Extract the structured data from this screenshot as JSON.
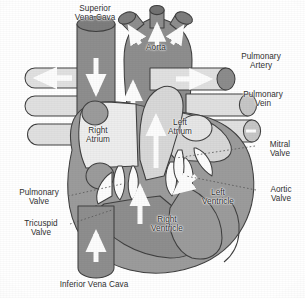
{
  "figure": {
    "type": "anatomical-diagram",
    "background_color": "#ffffff",
    "text_color": "#2e2e2e",
    "style": "grayscale scanned medical illustration"
  },
  "palette": {
    "deoxygenated_chamber": "#8c8c8c",
    "myocardium_wall": "#9a9a9a",
    "oxygenated_channel": "#d9d9d9",
    "vessel_light": "#e2e2e2",
    "vessel_cap_dark": "#7a7a7a",
    "valve_leaflet": "#ffffff",
    "outline": "#3a3a3a",
    "arrow": "#ffffff",
    "leader_line": "#555555"
  },
  "labels": [
    {
      "id": "superior-vena-cava",
      "text": "Superior\nVena Cava",
      "x": 58,
      "y": 4,
      "w": 74,
      "leader": false
    },
    {
      "id": "aorta",
      "text": "Aorta",
      "x": 136,
      "y": 43,
      "w": 40,
      "leader": false
    },
    {
      "id": "pulmonary-artery",
      "text": "Pulmonary\nArtery",
      "x": 228,
      "y": 52,
      "w": 66,
      "leader": false
    },
    {
      "id": "pulmonary-vein",
      "text": "Pulmonary\nVein",
      "x": 232,
      "y": 90,
      "w": 62,
      "leader": false
    },
    {
      "id": "right-atrium",
      "text": "Right\nAtrium",
      "x": 76,
      "y": 126,
      "w": 44,
      "leader": false
    },
    {
      "id": "left-atrium",
      "text": "Left\nAtrium",
      "x": 158,
      "y": 118,
      "w": 44,
      "leader": false
    },
    {
      "id": "mitral-valve",
      "text": "Mitral\nValve",
      "x": 258,
      "y": 140,
      "w": 44,
      "leader": true
    },
    {
      "id": "aortic-valve",
      "text": "Aortic\nValve",
      "x": 259,
      "y": 185,
      "w": 44,
      "leader": true
    },
    {
      "id": "pulmonary-valve",
      "text": "Pulmonary\nValve",
      "x": 8,
      "y": 188,
      "w": 62,
      "leader": true
    },
    {
      "id": "tricuspid-valve",
      "text": "Tricuspid\nValve",
      "x": 12,
      "y": 219,
      "w": 58,
      "leader": true
    },
    {
      "id": "left-ventricle",
      "text": "Left\nVentricle",
      "x": 192,
      "y": 188,
      "w": 52,
      "leader": false
    },
    {
      "id": "right-ventricle",
      "text": "Right\nVentricle",
      "x": 140,
      "y": 215,
      "w": 54,
      "leader": false
    },
    {
      "id": "inferior-vena-cava",
      "text": "Inferior Vena Cava",
      "x": 34,
      "y": 280,
      "w": 120,
      "leader": false
    }
  ],
  "structures": [
    {
      "id": "superior-vena-cava-vessel",
      "name": "Superior Vena Cava",
      "fill": "deoxygenated_chamber",
      "flow": "down"
    },
    {
      "id": "inferior-vena-cava-vessel",
      "name": "Inferior Vena Cava",
      "fill": "deoxygenated_chamber",
      "flow": "up"
    },
    {
      "id": "aorta-arch",
      "name": "Aorta",
      "fill": "deoxygenated_chamber",
      "flow": "up"
    },
    {
      "id": "ascending-aorta-channel",
      "name": "Ascending Aorta",
      "fill": "oxygenated_channel",
      "flow": "up"
    },
    {
      "id": "pulmonary-artery-vessel",
      "name": "Pulmonary Artery",
      "fill": "vessel_light",
      "flow": "right"
    },
    {
      "id": "pulmonary-vein-vessels",
      "name": "Pulmonary Veins",
      "fill": "vessel_light",
      "flow": "left"
    },
    {
      "id": "right-atrium-chamber",
      "name": "Right Atrium",
      "fill": "deoxygenated_chamber",
      "flow": "down"
    },
    {
      "id": "left-atrium-chamber",
      "name": "Left Atrium",
      "fill": "oxygenated_channel",
      "flow": "down"
    },
    {
      "id": "right-ventricle-chamber",
      "name": "Right Ventricle",
      "fill": "deoxygenated_chamber",
      "flow": "up"
    },
    {
      "id": "left-ventricle-chamber",
      "name": "Left Ventricle",
      "fill": "myocardium_wall",
      "flow": "up"
    },
    {
      "id": "tricuspid-valve-leaflets",
      "name": "Tricuspid Valve",
      "fill": "valve_leaflet",
      "flow": "none"
    },
    {
      "id": "mitral-valve-leaflets",
      "name": "Mitral Valve",
      "fill": "valve_leaflet",
      "flow": "none"
    },
    {
      "id": "pulmonary-valve-leaflets",
      "name": "Pulmonary Valve",
      "fill": "valve_leaflet",
      "flow": "none"
    },
    {
      "id": "aortic-valve-leaflets",
      "name": "Aortic Valve",
      "fill": "valve_leaflet",
      "flow": "none"
    }
  ]
}
